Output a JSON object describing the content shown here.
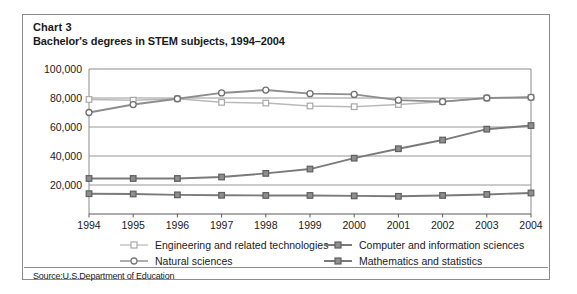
{
  "figure": {
    "chart_number": "Chart 3",
    "title": "Bachelor's degrees in STEM subjects, 1994–2004",
    "source": "Source:U.S.Department of Education"
  },
  "legend": {
    "entries": [
      {
        "label": "Engineering and related technologies",
        "marker": "open-square-light",
        "color": "#b9b9b9"
      },
      {
        "label": "Computer and information sciences",
        "marker": "filled-square",
        "color": "#7a7a7a"
      },
      {
        "label": "Natural sciences",
        "marker": "open-circle",
        "color": "#8d8d8d"
      },
      {
        "label": "Mathematics and statistics",
        "marker": "filled-square",
        "color": "#7a7a7a"
      }
    ]
  },
  "chart_data": {
    "type": "line",
    "title": "Bachelor's degrees in STEM subjects, 1994–2004",
    "xlabel": "",
    "ylabel": "",
    "categories": [
      "1994",
      "1995",
      "1996",
      "1997",
      "1998",
      "1999",
      "2000",
      "2001",
      "2002",
      "2003",
      "2004"
    ],
    "ylim": [
      0,
      100000
    ],
    "yticks": [
      20000,
      40000,
      60000,
      80000,
      100000
    ],
    "ytick_labels": [
      "20,000",
      "40,000",
      "60,000",
      "80,000",
      "100,000"
    ],
    "grid": true,
    "legend_position": "bottom",
    "series": [
      {
        "name": "Engineering and related technologies",
        "color": "#b9b9b9",
        "marker": "open-square-light",
        "values": [
          79000,
          78500,
          79500,
          77000,
          76500,
          74500,
          74000,
          75500,
          77500,
          80000,
          80500
        ]
      },
      {
        "name": "Natural sciences",
        "color": "#8d8d8d",
        "marker": "open-circle",
        "values": [
          70000,
          75500,
          79500,
          83500,
          85500,
          83000,
          82500,
          78500,
          77500,
          80000,
          80500
        ]
      },
      {
        "name": "Computer and information sciences",
        "color": "#7a7a7a",
        "marker": "filled-square",
        "values": [
          24500,
          24500,
          24500,
          25500,
          28000,
          31000,
          38500,
          45000,
          51000,
          58500,
          61000
        ]
      },
      {
        "name": "Mathematics and statistics",
        "color": "#7a7a7a",
        "marker": "filled-square",
        "values": [
          14000,
          13800,
          13200,
          12900,
          12800,
          12800,
          12500,
          12200,
          12800,
          13500,
          14500
        ]
      }
    ]
  }
}
